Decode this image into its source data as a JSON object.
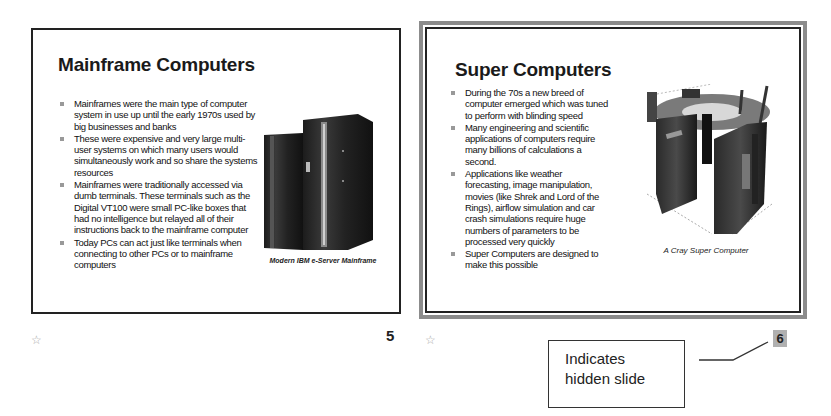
{
  "slides": [
    {
      "number": "5",
      "hidden": false,
      "title": "Mainframe Computers",
      "bullets": [
        "Mainframes were the main type of computer system in use up until the early 1970s used by big businesses and banks",
        "These were expensive and very large multi-user systems on which many users would simultaneously work and so share the systems resources",
        "Mainframes were traditionally accessed via dumb terminals. These terminals such as the Digital VT100 were small PC-like boxes that had no intelligence but relayed all of their instructions back to the mainframe computer",
        "Today PCs can act just like terminals when connecting to other PCs or to mainframe computers"
      ],
      "figure_caption": "Modern IBM e-Server Mainframe",
      "figure_icon": "mainframe-image"
    },
    {
      "number": "6",
      "hidden": true,
      "title": "Super Computers",
      "bullets": [
        "During the 70s a new breed of computer emerged which was tuned to perform with blinding speed",
        "Many engineering and scientific applications of computers require many billions of calculations a second.",
        "Applications like weather forecasting, image manipulation, movies (like Shrek and Lord of the Rings), airflow simulation and car crash simulations require huge numbers of parameters to be processed very quickly",
        "Super Computers are designed to make this possible"
      ],
      "figure_caption": "A Cray Super Computer",
      "figure_icon": "supercomputer-image"
    }
  ],
  "icons": {
    "transition": "star-icon"
  },
  "callout": {
    "line1": "Indicates",
    "line2": "hidden slide"
  },
  "colors": {
    "selected_frame": "#8c8c8c",
    "hidden_number_bg": "#b0b0b0",
    "bullet": "#999999"
  }
}
